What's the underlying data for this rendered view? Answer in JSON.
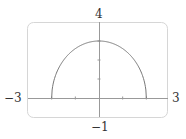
{
  "chart_data": {
    "type": "line",
    "title": "",
    "xlabel": "",
    "ylabel": "",
    "xlim": [
      -3,
      3
    ],
    "ylim": [
      -1,
      4
    ],
    "x_tick_labels": {
      "min": "−3",
      "max": "3"
    },
    "y_tick_labels": {
      "min": "−1",
      "max": "4"
    },
    "x_ticks": [
      -2,
      -1,
      0,
      1,
      2
    ],
    "y_ticks": [
      1,
      2,
      3
    ],
    "grid": false,
    "legend": null,
    "series": [
      {
        "name": "upper half of ellipse x²/4 + y²/9 = 1",
        "equation": "y = 3·sqrt(1 − x²/4)",
        "x": [
          -2,
          -1.75,
          -1.5,
          -1.25,
          -1,
          -0.75,
          -0.5,
          -0.25,
          0,
          0.25,
          0.5,
          0.75,
          1,
          1.25,
          1.5,
          1.75,
          2
        ],
        "values": [
          0,
          1.45,
          1.98,
          2.34,
          2.6,
          2.78,
          2.9,
          2.98,
          3,
          2.98,
          2.9,
          2.78,
          2.6,
          2.34,
          1.98,
          1.45,
          0
        ],
        "endpoints_vertical": true
      }
    ],
    "colors": {
      "curve": "#777777",
      "axes": "#999999",
      "frame": "#d6d6d6"
    }
  }
}
